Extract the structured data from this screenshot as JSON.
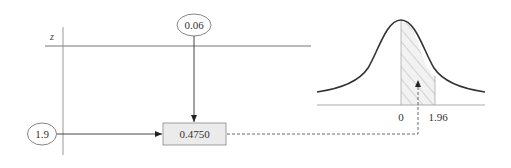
{
  "diagram": {
    "table_axis_label": "z",
    "column_header_value": "0.06",
    "row_header_value": "1.9",
    "table_entry_value": "0.4750",
    "curve_labels": {
      "mean": "0",
      "z_value": "1.96"
    }
  },
  "colors": {
    "line": "#555555",
    "box_fill": "#ebebeb",
    "hatch": "#999999",
    "curve": "#333333"
  }
}
